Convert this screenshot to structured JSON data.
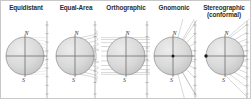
{
  "figure": {
    "width": 251,
    "height": 99,
    "background": "#ffffff",
    "border_color": "#c8c8c8"
  },
  "style": {
    "sphere_fill": "#d7d7d7",
    "sphere_stroke": "#8a8a8a",
    "axis_color": "#6e6e6e",
    "plane_color": "#9a9a9a",
    "ray_color": "#a0a0a0",
    "tick_color": "#8f8f8f",
    "point_color": "#1a1a1a",
    "title_color": "#2b2b2b",
    "pole_label_color": "#333333"
  },
  "panels": [
    {
      "id": "equidistant",
      "title_line1": "Equidistant",
      "title_line2": "",
      "north_label": "N",
      "south_label": "S",
      "projection_type": "equidistant",
      "description": "Evenly spaced parallels projected onto vertical plane",
      "x": 0,
      "sphere_cx": 24,
      "sphere_cy": 37,
      "sphere_r": 19,
      "plane_x": 46,
      "tick_count": 9,
      "has_center_point": false,
      "has_edge_point": false
    },
    {
      "id": "equal-area",
      "title_line1": "Equal-Area",
      "title_line2": "",
      "north_label": "N",
      "south_label": "S",
      "projection_type": "equal-area",
      "description": "Curved arc projection preserving area",
      "x": 50,
      "sphere_cx": 24,
      "sphere_cy": 37,
      "sphere_r": 19,
      "plane_x": 44,
      "tick_count": 7,
      "has_center_point": false,
      "has_edge_point": false
    },
    {
      "id": "orthographic",
      "title_line1": "Orthographic",
      "title_line2": "",
      "north_label": "N",
      "south_label": "S",
      "projection_type": "orthographic",
      "description": "Parallel horizontal rays from infinity",
      "x": 100,
      "sphere_cx": 25,
      "sphere_cy": 37,
      "sphere_r": 19,
      "plane_x": 46,
      "tick_count": 7,
      "has_center_point": false,
      "has_edge_point": false
    },
    {
      "id": "gnomonic",
      "title_line1": "Gnomonic",
      "title_line2": "",
      "north_label": "N",
      "south_label": "S",
      "projection_type": "gnomonic",
      "description": "Rays emanating from the sphere center",
      "x": 148,
      "sphere_cx": 24,
      "sphere_cy": 37,
      "sphere_r": 19,
      "plane_x": 46,
      "tick_count": 9,
      "has_center_point": true,
      "has_edge_point": false
    },
    {
      "id": "stereographic",
      "title_line1": "Stereographic",
      "title_line2": "(conformal)",
      "north_label": "N",
      "south_label": "S",
      "projection_type": "stereographic",
      "description": "Rays emanating from the far edge point of the sphere",
      "x": 198,
      "sphere_cx": 26,
      "sphere_cy": 37,
      "sphere_r": 19,
      "plane_x": 48,
      "tick_count": 9,
      "has_center_point": false,
      "has_edge_point": true
    }
  ]
}
